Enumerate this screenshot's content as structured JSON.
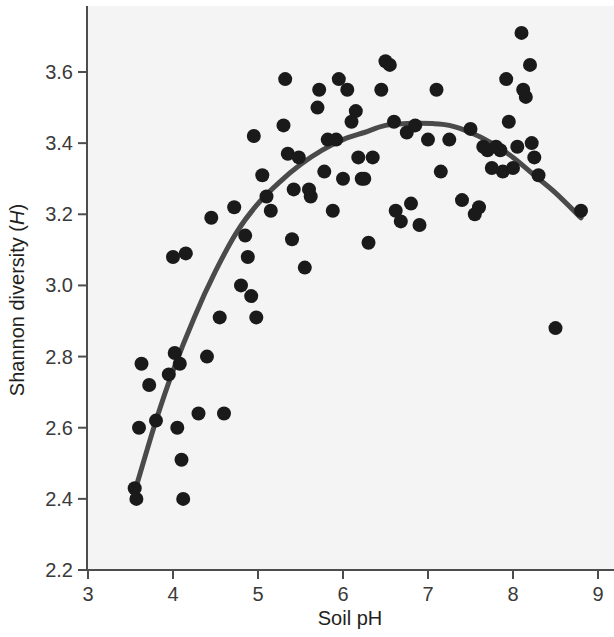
{
  "chart_data": {
    "type": "scatter",
    "title": "",
    "xlabel": "Soil pH",
    "ylabel": "Shannon diversity (H)",
    "ylabel_plain": "Shannon diversity",
    "ylabel_symbol": "H",
    "xlim": [
      3,
      9
    ],
    "ylim": [
      2.2,
      3.8
    ],
    "xticks": [
      3,
      4,
      5,
      6,
      7,
      8,
      9
    ],
    "xtick_labels": [
      "3",
      "4",
      "5",
      "6",
      "7",
      "8",
      "9"
    ],
    "yticks": [
      2.2,
      2.4,
      2.6,
      2.8,
      3.0,
      3.2,
      3.4,
      3.6
    ],
    "ytick_labels": [
      "2.2",
      "2.4",
      "2.6",
      "2.8",
      "3.0",
      "3.2",
      "3.4",
      "3.6"
    ],
    "grid": false,
    "legend": null,
    "point_color": "#1a1a1a",
    "curve_color": "#4a4a4a",
    "plot_background": "#f4f4f4",
    "marker_radius_px": 7,
    "series": [
      {
        "name": "Soil samples",
        "marker": "filled-circle",
        "points": [
          [
            3.55,
            2.43
          ],
          [
            3.57,
            2.4
          ],
          [
            3.6,
            2.6
          ],
          [
            3.63,
            2.78
          ],
          [
            3.72,
            2.72
          ],
          [
            3.8,
            2.62
          ],
          [
            3.95,
            2.75
          ],
          [
            4.0,
            3.08
          ],
          [
            4.02,
            2.81
          ],
          [
            4.05,
            2.6
          ],
          [
            4.08,
            2.78
          ],
          [
            4.1,
            2.51
          ],
          [
            4.12,
            2.4
          ],
          [
            4.15,
            3.09
          ],
          [
            4.3,
            2.64
          ],
          [
            4.4,
            2.8
          ],
          [
            4.45,
            3.19
          ],
          [
            4.55,
            2.91
          ],
          [
            4.6,
            2.64
          ],
          [
            4.72,
            3.22
          ],
          [
            4.8,
            3.0
          ],
          [
            4.85,
            3.14
          ],
          [
            4.88,
            3.08
          ],
          [
            4.92,
            2.97
          ],
          [
            4.95,
            3.42
          ],
          [
            4.98,
            2.91
          ],
          [
            5.05,
            3.31
          ],
          [
            5.1,
            3.25
          ],
          [
            5.15,
            3.21
          ],
          [
            5.3,
            3.45
          ],
          [
            5.32,
            3.58
          ],
          [
            5.35,
            3.37
          ],
          [
            5.4,
            3.13
          ],
          [
            5.42,
            3.27
          ],
          [
            5.48,
            3.36
          ],
          [
            5.55,
            3.05
          ],
          [
            5.6,
            3.27
          ],
          [
            5.62,
            3.25
          ],
          [
            5.7,
            3.5
          ],
          [
            5.72,
            3.55
          ],
          [
            5.78,
            3.32
          ],
          [
            5.82,
            3.41
          ],
          [
            5.88,
            3.21
          ],
          [
            5.92,
            3.41
          ],
          [
            5.95,
            3.58
          ],
          [
            6.0,
            3.3
          ],
          [
            6.05,
            3.55
          ],
          [
            6.1,
            3.46
          ],
          [
            6.15,
            3.49
          ],
          [
            6.18,
            3.36
          ],
          [
            6.22,
            3.3
          ],
          [
            6.25,
            3.3
          ],
          [
            6.3,
            3.12
          ],
          [
            6.35,
            3.36
          ],
          [
            6.45,
            3.55
          ],
          [
            6.5,
            3.63
          ],
          [
            6.55,
            3.62
          ],
          [
            6.6,
            3.46
          ],
          [
            6.62,
            3.21
          ],
          [
            6.68,
            3.18
          ],
          [
            6.75,
            3.43
          ],
          [
            6.8,
            3.23
          ],
          [
            6.85,
            3.45
          ],
          [
            6.9,
            3.17
          ],
          [
            7.0,
            3.41
          ],
          [
            7.1,
            3.55
          ],
          [
            7.15,
            3.32
          ],
          [
            7.25,
            3.41
          ],
          [
            7.4,
            3.24
          ],
          [
            7.5,
            3.44
          ],
          [
            7.55,
            3.2
          ],
          [
            7.6,
            3.22
          ],
          [
            7.65,
            3.39
          ],
          [
            7.7,
            3.38
          ],
          [
            7.75,
            3.33
          ],
          [
            7.8,
            3.39
          ],
          [
            7.85,
            3.38
          ],
          [
            7.88,
            3.32
          ],
          [
            7.92,
            3.58
          ],
          [
            7.95,
            3.46
          ],
          [
            8.0,
            3.33
          ],
          [
            8.05,
            3.39
          ],
          [
            8.1,
            3.71
          ],
          [
            8.12,
            3.55
          ],
          [
            8.15,
            3.53
          ],
          [
            8.2,
            3.62
          ],
          [
            8.22,
            3.4
          ],
          [
            8.25,
            3.36
          ],
          [
            8.3,
            3.31
          ],
          [
            8.5,
            2.88
          ],
          [
            8.8,
            3.21
          ]
        ]
      }
    ],
    "fit": {
      "name": "Quadratic fit",
      "type": "quadratic",
      "x_range": [
        3.55,
        8.8
      ],
      "vertex": [
        7.05,
        3.455
      ],
      "points": [
        [
          3.55,
          2.42
        ],
        [
          3.8,
          2.62
        ],
        [
          4.0,
          2.76
        ],
        [
          4.25,
          2.91
        ],
        [
          4.5,
          3.04
        ],
        [
          4.75,
          3.15
        ],
        [
          5.0,
          3.23
        ],
        [
          5.25,
          3.29
        ],
        [
          5.5,
          3.34
        ],
        [
          5.75,
          3.38
        ],
        [
          6.0,
          3.41
        ],
        [
          6.25,
          3.43
        ],
        [
          6.5,
          3.45
        ],
        [
          6.75,
          3.455
        ],
        [
          7.05,
          3.455
        ],
        [
          7.25,
          3.45
        ],
        [
          7.5,
          3.43
        ],
        [
          7.75,
          3.4
        ],
        [
          8.0,
          3.36
        ],
        [
          8.25,
          3.31
        ],
        [
          8.5,
          3.26
        ],
        [
          8.8,
          3.19
        ]
      ]
    }
  },
  "axes_geometry": {
    "plot_left_px": 86,
    "plot_right_px": 614,
    "plot_top_px": 8,
    "plot_bottom_px": 570,
    "x_tick_px": [
      88,
      173,
      258,
      343,
      428,
      513,
      598
    ],
    "y_tick_px": [
      570,
      503,
      437,
      356,
      285,
      214,
      143,
      72
    ]
  }
}
